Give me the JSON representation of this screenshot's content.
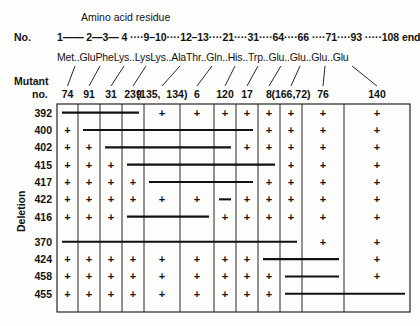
{
  "figure": {
    "type": "deletion-mapping-grid",
    "header_title": "Amino acid residue",
    "row_label_no": "No.",
    "mutant_label_line1": "Mutant",
    "mutant_label_line2": "no.",
    "deletion_axis_label": "Deletion",
    "plus_symbol": "+",
    "residue_numbers_raw": "1—— 2—3— 4 ····9–10····12–13····21····31····64····66 ····71····93 ·····108 end",
    "amino_acids_raw": "Met..GluPheLys..LysLys..AlaThr..Gln..His..Trp..Glu..Glu..Glu..Glu"
  },
  "residue_positions": [
    {
      "num": "1",
      "aa": "Met"
    },
    {
      "num": "2",
      "aa": "Glu"
    },
    {
      "num": "3",
      "aa": "Phe"
    },
    {
      "num": "4",
      "aa": "Lys"
    },
    {
      "num": "9",
      "aa": "Lys"
    },
    {
      "num": "10",
      "aa": "Lys"
    },
    {
      "num": "12",
      "aa": "Ala"
    },
    {
      "num": "13",
      "aa": "Thr"
    },
    {
      "num": "21",
      "aa": "Gln"
    },
    {
      "num": "31",
      "aa": "His"
    },
    {
      "num": "64",
      "aa": "Trp"
    },
    {
      "num": "66",
      "aa": "Glu"
    },
    {
      "num": "71",
      "aa": "Glu"
    },
    {
      "num": "93",
      "aa": "Glu"
    },
    {
      "num": "108",
      "aa": "Glu"
    }
  ],
  "columns": [
    {
      "index": 1,
      "mutant": "74"
    },
    {
      "index": 2,
      "mutant": "91"
    },
    {
      "index": 3,
      "mutant": "31"
    },
    {
      "index": 4,
      "mutant": "239"
    },
    {
      "index": 5,
      "mutant": "(135,  134)"
    },
    {
      "index": 6,
      "mutant": "6"
    },
    {
      "index": 7,
      "mutant": "120"
    },
    {
      "index": 8,
      "mutant": "17"
    },
    {
      "index": 9,
      "mutant": "8"
    },
    {
      "index": 10,
      "mutant": "(166,72)"
    },
    {
      "index": 11,
      "mutant": "76"
    },
    {
      "index": 12,
      "mutant": "140"
    }
  ],
  "rows": [
    {
      "deletion": "392",
      "cells": [
        "bar",
        "bar",
        "bar",
        "bar",
        "+",
        "+",
        "+",
        "+",
        "+",
        "+",
        "+",
        "+"
      ]
    },
    {
      "deletion": "400",
      "cells": [
        "+",
        "bar",
        "bar",
        "bar",
        "bar",
        "bar",
        "bar",
        "bar",
        "+",
        "+",
        "+",
        "+"
      ]
    },
    {
      "deletion": "402",
      "cells": [
        "+",
        "+",
        "bar",
        "bar",
        "bar",
        "bar",
        "bar",
        "+",
        "+",
        "+",
        "+",
        "+"
      ]
    },
    {
      "deletion": "415",
      "cells": [
        "+",
        "+",
        "+",
        "bar",
        "bar",
        "bar",
        "bar",
        "bar",
        "bar",
        "+",
        "+",
        "+"
      ]
    },
    {
      "deletion": "417",
      "cells": [
        "+",
        "+",
        "+",
        "+",
        "bar",
        "bar",
        "bar",
        "bar",
        "+",
        "+",
        "+",
        "+"
      ]
    },
    {
      "deletion": "422",
      "cells": [
        "+",
        "+",
        "+",
        "+",
        "+",
        "+",
        "bar",
        "+",
        "+",
        "+",
        "+",
        "+"
      ]
    },
    {
      "deletion": "416",
      "cells": [
        "+",
        "+",
        "+",
        "bar",
        "bar",
        "bar",
        "+",
        "+",
        "+",
        "+",
        "+",
        "+"
      ]
    },
    {
      "deletion": "370",
      "cells": [
        "bar",
        "bar",
        "bar",
        "bar",
        "bar",
        "bar",
        "bar",
        "bar",
        "bar",
        "bar",
        "+",
        "+"
      ]
    },
    {
      "deletion": "424",
      "cells": [
        "+",
        "+",
        "+",
        "+",
        "+",
        "+",
        "+",
        "+",
        "bar",
        "bar",
        "bar",
        "+"
      ]
    },
    {
      "deletion": "458",
      "cells": [
        "+",
        "+",
        "+",
        "+",
        "+",
        "+",
        "+",
        "+",
        "+",
        "bar",
        "bar",
        "+"
      ]
    },
    {
      "deletion": "455",
      "cells": [
        "+",
        "+",
        "+",
        "+",
        "+",
        "+",
        "+",
        "+",
        "+",
        "bar",
        "bar",
        "bar"
      ]
    }
  ],
  "colors": {
    "ink": "#111111",
    "paper": "#fdfdfb"
  }
}
